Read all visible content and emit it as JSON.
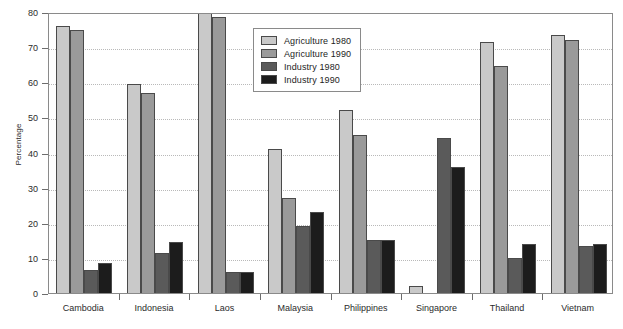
{
  "chart_data": {
    "type": "bar",
    "title": "",
    "xlabel": "",
    "ylabel": "Percentage",
    "ylim": [
      0,
      80
    ],
    "ytick_step": 10,
    "yticks": [
      0,
      10,
      20,
      30,
      40,
      50,
      60,
      70,
      80
    ],
    "grid": true,
    "legend_position": "top-center-inside",
    "categories": [
      "Cambodia",
      "Indonesia",
      "Laos",
      "Malaysia",
      "Philippines",
      "Singapore",
      "Thailand",
      "Vietnam"
    ],
    "series": [
      {
        "name": "Agriculture 1980",
        "color": "#c9c9c9",
        "values": [
          76,
          59.5,
          80.5,
          41,
          52,
          2,
          71.5,
          73.5
        ]
      },
      {
        "name": "Agriculture 1990",
        "color": "#9a9a9a",
        "values": [
          75,
          57,
          78.5,
          27,
          45,
          0,
          64.5,
          72
        ]
      },
      {
        "name": "Industry 1980",
        "color": "#5a5a5a",
        "values": [
          6.5,
          11.5,
          6,
          19,
          15,
          44,
          10,
          13.5
        ]
      },
      {
        "name": "Industry 1990",
        "color": "#1c1c1c",
        "values": [
          8.5,
          14.5,
          6,
          23,
          15,
          36,
          14,
          14
        ]
      }
    ],
    "notes": {
      "clipped_bars": "Laos Agriculture 1980 extends above the 80 axis maximum",
      "missing_bars": "Singapore Agriculture 1990 is zero / not drawn"
    }
  }
}
